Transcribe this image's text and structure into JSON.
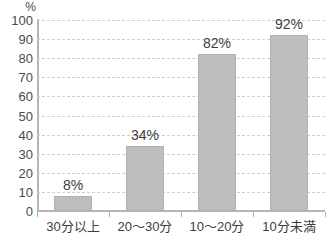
{
  "chart_data": {
    "type": "bar",
    "title": "",
    "subtitle": "",
    "xlabel": "",
    "ylabel": "",
    "unit_label": "%",
    "categories": [
      "30分以上",
      "20～30分",
      "10～20分",
      "10分未満"
    ],
    "values": [
      8,
      34,
      82,
      92
    ],
    "data_labels": [
      "8%",
      "34%",
      "82%",
      "92%"
    ],
    "ylim": [
      0,
      100
    ],
    "ytick_step": 10,
    "ytick_labels": [
      "100",
      "90",
      "80",
      "70",
      "60",
      "50",
      "40",
      "30",
      "20",
      "10",
      "0"
    ],
    "ytick_values": [
      100,
      90,
      80,
      70,
      60,
      50,
      40,
      30,
      20,
      10,
      0
    ],
    "grid": true,
    "grid_style": "dashed-horizontal",
    "legend": false,
    "legend_position": "none",
    "orientation": "vertical",
    "colors": {
      "bar_fill": "#bebebe",
      "bar_border": "#b2b2b2",
      "gridline": "#cfcfcf",
      "axis_line": "#b5b5b5",
      "tick_text": "#4a4a4a",
      "label_text": "#3d3d3d",
      "background": "#ffffff"
    }
  }
}
